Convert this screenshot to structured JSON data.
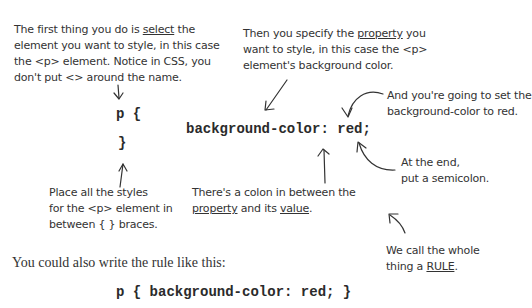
{
  "annotations": {
    "select": {
      "line1_pre": "The first thing you do is ",
      "line1_ul": "select",
      "line1_post": " the",
      "line2": "element you want to style, in this case",
      "line3": "the <p> element. Notice in CSS, you",
      "line4": "don't put <> around the name."
    },
    "property": {
      "line1_pre": "Then you specify the ",
      "line1_ul": "property",
      "line1_post": " you",
      "line2": "want to style, in this case the <p>",
      "line3": "element's background color."
    },
    "value": {
      "line1": "And you're going to set the",
      "line2": "background-color to red."
    },
    "semicolon": {
      "line1": "At the end,",
      "line2": "put a semicolon."
    },
    "braces": {
      "line1": "Place all the styles",
      "line2": "for the <p> element in",
      "line3": "between { } braces."
    },
    "colon": {
      "line1": "There's a colon in between the",
      "line2_ul1": "property",
      "line2_mid": " and its ",
      "line2_ul2": "value",
      "line2_post": "."
    },
    "rule": {
      "line1": "We call the whole",
      "line2_pre": "thing a ",
      "line2_ul": "RULE",
      "line2_post": "."
    }
  },
  "code": {
    "selector_open": "p {",
    "declaration": "background-color: red;",
    "close_brace": "}",
    "one_line": "p { background-color: red; }"
  },
  "body_text": {
    "alternative": "You could also write the rule like this:"
  }
}
